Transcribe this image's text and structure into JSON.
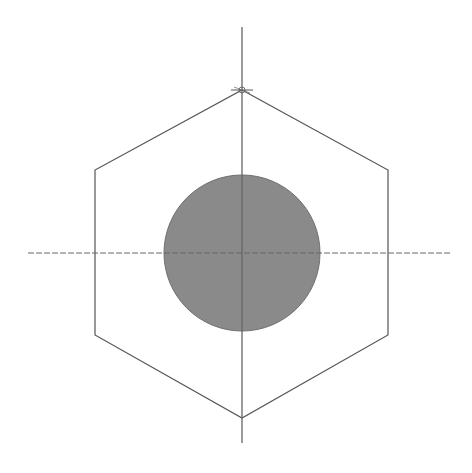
{
  "diagram": {
    "type": "hex-nut-top-view",
    "background": "#ffffff",
    "hexagon": {
      "points": [
        [
          242,
          90
        ],
        [
          388,
          170
        ],
        [
          388,
          335
        ],
        [
          242,
          418
        ],
        [
          95,
          335
        ],
        [
          95,
          170
        ]
      ],
      "stroke": "#555555",
      "stroke_width": 1.2
    },
    "circle": {
      "cx": 242,
      "cy": 253,
      "r": 78,
      "fill": "#8a8a8a",
      "stroke": "#6e6e6e"
    },
    "centerlines": {
      "vertical": {
        "x": 242,
        "y1": 27,
        "y2": 443
      },
      "horizontal": {
        "y": 253,
        "x1": 28,
        "x2": 452
      },
      "stroke": "#666666",
      "dash": "6,2"
    },
    "vertex_marker": {
      "x": 242,
      "y": 90
    }
  }
}
